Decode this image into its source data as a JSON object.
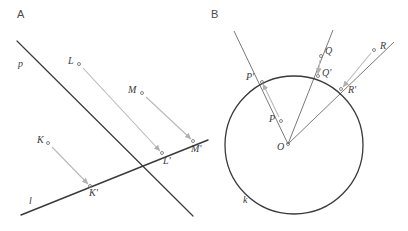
{
  "figure": {
    "width": 408,
    "height": 231,
    "background": "#ffffff",
    "stroke_dark": "#3a3a3a",
    "stroke_mid": "#6a6a6a",
    "stroke_light": "#b9b9b9",
    "label_color": "#3b3b3b",
    "panel_label_color": "#4a4a4a"
  },
  "panels": [
    {
      "id": "A",
      "label": "A",
      "label_pos": {
        "x": 17,
        "y": 18
      },
      "description": "Orthogonal projection of points K, L, M onto line l along direction parallel to line p",
      "lines": [
        {
          "name": "line-p",
          "label": "p",
          "label_pos": {
            "x": 18,
            "y": 67
          },
          "x1": 17,
          "y1": 41,
          "x2": 193,
          "y2": 216,
          "color": "#3a3a3a",
          "width": 1.2
        },
        {
          "name": "line-l",
          "label": "l",
          "label_pos": {
            "x": 29,
            "y": 204
          },
          "x1": 21,
          "y1": 215,
          "x2": 208,
          "y2": 140,
          "color": "#3a3a3a",
          "width": 1.4
        }
      ],
      "points": [
        {
          "name": "K",
          "label": "K",
          "x": 48,
          "y": 143,
          "label_pos": {
            "x": 37,
            "y": 143
          }
        },
        {
          "name": "L",
          "label": "L",
          "x": 79,
          "y": 64,
          "label_pos": {
            "x": 68,
            "y": 64
          }
        },
        {
          "name": "M",
          "label": "M",
          "x": 142,
          "y": 93,
          "label_pos": {
            "x": 128,
            "y": 93
          }
        },
        {
          "name": "K'",
          "label": "K'",
          "x": 90,
          "y": 186,
          "label_pos": {
            "x": 89,
            "y": 196
          }
        },
        {
          "name": "L'",
          "label": "L'",
          "x": 162,
          "y": 153,
          "label_pos": {
            "x": 163,
            "y": 164
          }
        },
        {
          "name": "M'",
          "label": "M'",
          "x": 193,
          "y": 141,
          "label_pos": {
            "x": 191,
            "y": 152
          }
        }
      ],
      "arrows": [
        {
          "name": "arrow-K-to-Kprime",
          "from": "K",
          "to": "K'",
          "x1": 52,
          "y1": 147,
          "x2": 88,
          "y2": 184,
          "color": "#b9b9b9"
        },
        {
          "name": "arrow-L-to-Lprime",
          "from": "L",
          "to": "L'",
          "x1": 83,
          "y1": 68,
          "x2": 160,
          "y2": 151,
          "color": "#b9b9b9"
        },
        {
          "name": "arrow-M-to-Mprime",
          "from": "M",
          "to": "M'",
          "x1": 146,
          "y1": 97,
          "x2": 191,
          "y2": 139,
          "color": "#b9b9b9"
        }
      ]
    },
    {
      "id": "B",
      "label": "B",
      "label_pos": {
        "x": 211,
        "y": 18
      },
      "description": "Central projection from point O of points P, Q, R onto circle k at P', Q', R'",
      "circle": {
        "name": "circle-k",
        "label": "k",
        "label_pos": {
          "x": 243,
          "y": 203
        },
        "cx": 294,
        "cy": 145,
        "r": 69,
        "color": "#3a3a3a",
        "width": 1.3
      },
      "center": {
        "name": "O",
        "label": "O",
        "x": 288,
        "y": 144,
        "label_pos": {
          "x": 277,
          "y": 150
        }
      },
      "rays": [
        {
          "name": "ray-O-through-P",
          "x1": 288,
          "y1": 144,
          "x2": 234,
          "y2": 31,
          "color": "#6a6a6a"
        },
        {
          "name": "ray-O-through-Q",
          "x1": 288,
          "y1": 144,
          "x2": 333,
          "y2": 30,
          "color": "#6a6a6a"
        },
        {
          "name": "ray-O-through-R",
          "x1": 288,
          "y1": 144,
          "x2": 394,
          "y2": 42,
          "color": "#6a6a6a"
        }
      ],
      "points": [
        {
          "name": "P",
          "label": "P",
          "x": 281,
          "y": 121,
          "label_pos": {
            "x": 269,
            "y": 122
          }
        },
        {
          "name": "Q",
          "label": "Q",
          "x": 321,
          "y": 56,
          "label_pos": {
            "x": 325,
            "y": 54
          }
        },
        {
          "name": "R",
          "label": "R",
          "x": 374,
          "y": 50,
          "label_pos": {
            "x": 380,
            "y": 49
          }
        },
        {
          "name": "P'",
          "label": "P'",
          "x": 262,
          "y": 82,
          "label_pos": {
            "x": 246,
            "y": 80
          }
        },
        {
          "name": "Q'",
          "label": "Q'",
          "x": 318,
          "y": 76,
          "label_pos": {
            "x": 322,
            "y": 76
          }
        },
        {
          "name": "R'",
          "label": "R'",
          "x": 341,
          "y": 89,
          "label_pos": {
            "x": 348,
            "y": 93
          }
        }
      ],
      "arrows": [
        {
          "name": "arrow-P-to-Pprime",
          "from": "P",
          "to": "P'",
          "x1": 279,
          "y1": 117,
          "x2": 263,
          "y2": 84,
          "color": "#b9b9b9"
        },
        {
          "name": "arrow-Q-to-Qprime",
          "from": "Q",
          "to": "Q'",
          "x1": 320,
          "y1": 60,
          "x2": 318,
          "y2": 74,
          "color": "#b9b9b9"
        },
        {
          "name": "arrow-R-to-Rprime",
          "from": "R",
          "to": "R'",
          "x1": 371,
          "y1": 53,
          "x2": 343,
          "y2": 87,
          "color": "#b9b9b9"
        }
      ]
    }
  ]
}
